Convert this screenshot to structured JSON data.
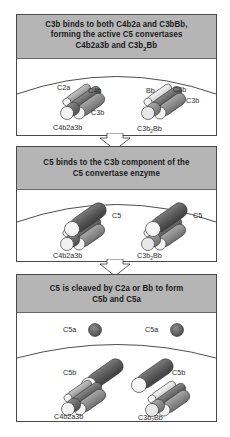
{
  "panels": [
    {
      "header_lines": [
        "C3b binds to both C4b2a and C3bBb,",
        "forming the active C5 convertases",
        "C4b2a3b and C3b₂Bb"
      ],
      "labels": {
        "left_c2a": "C2a",
        "left_c4b": "C4b",
        "left_c3b": "C3b",
        "left_complex": "C4b2a3b",
        "right_bb": "Bb",
        "right_c3b_top": "C3b",
        "right_c3b": "C3b",
        "right_complex_main": "C3b",
        "right_complex_sub": "2",
        "right_complex_tail": "Bb"
      }
    },
    {
      "header_lines": [
        "C5 binds to the C3b component of the",
        "C5 convertase enzyme"
      ],
      "labels": {
        "left_c5": "C5",
        "left_complex": "C4b2a3b",
        "right_c5": "C5",
        "right_complex_main": "C3b",
        "right_complex_sub": "2",
        "right_complex_tail": "Bb"
      }
    },
    {
      "header_lines": [
        "C5 is cleaved by C2a or Bb to form",
        "C5b and C5a"
      ],
      "labels": {
        "left_c5a": "C5a",
        "right_c5a": "C5a",
        "left_c5b": "C5b",
        "right_c5b": "C5b",
        "left_complex": "C4b2a3b",
        "right_complex_main": "C3b",
        "right_complex_sub": "2",
        "right_complex_tail": "Bb"
      }
    }
  ],
  "colors": {
    "header_bg": "#b5b5b5",
    "border": "#4a4a4a",
    "c4b_dark": "#6f6f6f",
    "c3b_mid": "#8a8a8a",
    "c2a_light": "#a8a8a8",
    "bb_pale": "#e6e6e6",
    "c5_dark": "#5c5c5c",
    "end_cap": "#f2f2f2"
  }
}
